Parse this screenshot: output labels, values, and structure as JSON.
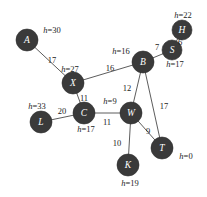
{
  "figure": {
    "type": "undirected-weighted-graph-with-heuristics",
    "width": 207,
    "height": 197,
    "background_color": "#ffffff",
    "node_fill_color": "#3a3a3a",
    "node_label_color": "#ffffff",
    "edge_color": "#4a4a4a",
    "text_color": "#1c1c1c"
  },
  "chart_data": {
    "type": "diagram",
    "title": "",
    "nodes": [
      {
        "id": "A",
        "label": "A",
        "heuristic_text": "h=30",
        "heuristic_value": 30,
        "x": 27,
        "y": 40,
        "r": 11,
        "h_label_x": 52,
        "h_label_y": 30
      },
      {
        "id": "X",
        "label": "X",
        "heuristic_text": "h=27",
        "heuristic_value": 27,
        "x": 73,
        "y": 83,
        "r": 11,
        "h_label_x": 70,
        "h_label_y": 69
      },
      {
        "id": "B",
        "label": "B",
        "heuristic_text": "h=16",
        "heuristic_value": 16,
        "x": 143,
        "y": 62,
        "r": 11,
        "h_label_x": 121,
        "h_label_y": 51
      },
      {
        "id": "S",
        "label": "S",
        "heuristic_text": "h=17",
        "heuristic_value": 17,
        "x": 172,
        "y": 50,
        "r": 10,
        "h_label_x": 175,
        "h_label_y": 64
      },
      {
        "id": "H",
        "label": "H",
        "heuristic_text": "h=22",
        "heuristic_value": 22,
        "x": 182,
        "y": 30,
        "r": 10,
        "h_label_x": 183,
        "h_label_y": 15
      },
      {
        "id": "C",
        "label": "C",
        "heuristic_text": "h=17",
        "heuristic_value": 17,
        "x": 84,
        "y": 113,
        "r": 11,
        "h_label_x": 86,
        "h_label_y": 129
      },
      {
        "id": "L",
        "label": "L",
        "heuristic_text": "h=33",
        "heuristic_value": 33,
        "x": 41,
        "y": 122,
        "r": 11,
        "h_label_x": 37,
        "h_label_y": 106
      },
      {
        "id": "W",
        "label": "W",
        "heuristic_text": "h=9",
        "heuristic_value": 9,
        "x": 131,
        "y": 113,
        "r": 11,
        "h_label_x": 110,
        "h_label_y": 101
      },
      {
        "id": "T",
        "label": "T",
        "heuristic_text": "h=0",
        "heuristic_value": 0,
        "x": 162,
        "y": 148,
        "r": 11,
        "h_label_x": 186,
        "h_label_y": 156
      },
      {
        "id": "K",
        "label": "K",
        "heuristic_text": "h=19",
        "heuristic_value": 19,
        "x": 128,
        "y": 165,
        "r": 11,
        "h_label_x": 130,
        "h_label_y": 183
      }
    ],
    "edges": [
      {
        "from": "A",
        "to": "X",
        "weight": 17,
        "label_x": 52,
        "label_y": 60
      },
      {
        "from": "X",
        "to": "B",
        "weight": 16,
        "label_x": 110,
        "label_y": 68
      },
      {
        "from": "X",
        "to": "C",
        "weight": 11,
        "label_x": 84,
        "label_y": 98
      },
      {
        "from": "B",
        "to": "S",
        "weight": 7,
        "label_x": 157,
        "label_y": 47
      },
      {
        "from": "S",
        "to": "H",
        "weight": 6,
        "label_x": 180,
        "label_y": 42
      },
      {
        "from": "B",
        "to": "W",
        "weight": 12,
        "label_x": 127,
        "label_y": 88
      },
      {
        "from": "B",
        "to": "T",
        "weight": 17,
        "label_x": 164,
        "label_y": 106
      },
      {
        "from": "C",
        "to": "L",
        "weight": 20,
        "label_x": 62,
        "label_y": 111
      },
      {
        "from": "C",
        "to": "W",
        "weight": 11,
        "label_x": 107,
        "label_y": 122
      },
      {
        "from": "W",
        "to": "T",
        "weight": 9,
        "label_x": 148,
        "label_y": 131
      },
      {
        "from": "W",
        "to": "K",
        "weight": 10,
        "label_x": 117,
        "label_y": 143
      }
    ]
  }
}
